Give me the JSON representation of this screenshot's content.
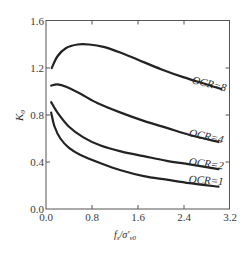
{
  "chart_data": {
    "type": "line",
    "title": "",
    "xlabel": "fs/σ'v0",
    "ylabel": "K0",
    "xlim": [
      0.0,
      3.2
    ],
    "ylim": [
      0.0,
      1.6
    ],
    "xticks": [
      "0.0",
      "0.8",
      "1.6",
      "2.4",
      "3.2"
    ],
    "yticks": [
      "0.0",
      "0.4",
      "0.8",
      "1.2",
      "1.6"
    ],
    "grid": false,
    "legend_position": "inline labels at right end of curves",
    "series": [
      {
        "name": "OCR=8",
        "x": [
          0.1,
          0.2,
          0.35,
          0.55,
          0.75,
          1.0,
          1.3,
          1.6,
          2.0,
          2.4,
          2.8,
          3.05
        ],
        "y": [
          1.2,
          1.3,
          1.37,
          1.4,
          1.4,
          1.38,
          1.33,
          1.27,
          1.19,
          1.12,
          1.06,
          1.02
        ]
      },
      {
        "name": "OCR=4",
        "x": [
          0.09,
          0.2,
          0.35,
          0.6,
          0.9,
          1.3,
          1.7,
          2.1,
          2.5,
          3.0
        ],
        "y": [
          1.05,
          1.06,
          1.04,
          0.98,
          0.9,
          0.82,
          0.75,
          0.69,
          0.63,
          0.57
        ]
      },
      {
        "name": "OCR=2",
        "x": [
          0.09,
          0.2,
          0.4,
          0.65,
          0.95,
          1.3,
          1.7,
          2.1,
          2.5,
          3.0
        ],
        "y": [
          0.91,
          0.82,
          0.7,
          0.61,
          0.54,
          0.49,
          0.45,
          0.41,
          0.38,
          0.34
        ]
      },
      {
        "name": "OCR=1",
        "x": [
          0.09,
          0.15,
          0.25,
          0.4,
          0.6,
          0.95,
          1.3,
          1.7,
          2.1,
          2.5,
          3.0
        ],
        "y": [
          0.82,
          0.7,
          0.6,
          0.52,
          0.46,
          0.39,
          0.33,
          0.28,
          0.25,
          0.22,
          0.19
        ]
      }
    ]
  },
  "labels": {
    "x_axis_main": "f",
    "x_axis_main_sub": "s",
    "x_axis_denom": "/σ'",
    "x_axis_denom_sub": "v0",
    "y_axis_main": "K",
    "y_axis_sub": "0"
  }
}
